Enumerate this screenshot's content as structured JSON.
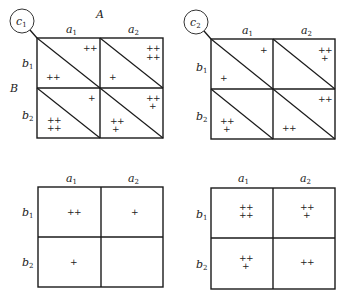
{
  "panels": [
    {
      "id": "top-left",
      "circle_label": "c",
      "circle_sub": "1",
      "factor_A": "A",
      "factor_B": "B",
      "col_labels": [
        {
          "base": "a",
          "sub": "1"
        },
        {
          "base": "a",
          "sub": "2"
        }
      ],
      "row_labels": [
        {
          "base": "b",
          "sub": "1"
        },
        {
          "base": "b",
          "sub": "2"
        }
      ],
      "split_diagonal": true,
      "cells": {
        "b1a1": {
          "upper": [
            "++"
          ],
          "lower": [
            "++"
          ]
        },
        "b1a2": {
          "upper": [
            "++",
            "++"
          ],
          "lower": [
            "+"
          ]
        },
        "b2a1": {
          "upper": [
            "+"
          ],
          "lower": [
            "++",
            "++"
          ]
        },
        "b2a2": {
          "upper": [
            "++",
            "+"
          ],
          "lower": [
            "++",
            "+"
          ]
        }
      }
    },
    {
      "id": "top-right",
      "circle_label": "c",
      "circle_sub": "2",
      "col_labels": [
        {
          "base": "a",
          "sub": "1"
        },
        {
          "base": "a",
          "sub": "2"
        }
      ],
      "row_labels": [
        {
          "base": "b",
          "sub": "1"
        },
        {
          "base": "b",
          "sub": "2"
        }
      ],
      "split_diagonal": true,
      "cells": {
        "b1a1": {
          "upper": [
            "+"
          ],
          "lower": [
            "+"
          ]
        },
        "b1a2": {
          "upper": [
            "++",
            "+"
          ],
          "lower": []
        },
        "b2a1": {
          "upper": [],
          "lower": [
            "++",
            "+"
          ]
        },
        "b2a2": {
          "upper": [
            "++"
          ],
          "lower": [
            "++"
          ]
        }
      }
    },
    {
      "id": "bottom-left",
      "col_labels": [
        {
          "base": "a",
          "sub": "1"
        },
        {
          "base": "a",
          "sub": "2"
        }
      ],
      "row_labels": [
        {
          "base": "b",
          "sub": "1"
        },
        {
          "base": "b",
          "sub": "2"
        }
      ],
      "split_diagonal": false,
      "cells": {
        "b1a1": [
          "++"
        ],
        "b1a2": [
          "+"
        ],
        "b2a1": [
          "+"
        ],
        "b2a2": []
      }
    },
    {
      "id": "bottom-right",
      "col_labels": [
        {
          "base": "a",
          "sub": "1"
        },
        {
          "base": "a",
          "sub": "2"
        }
      ],
      "row_labels": [
        {
          "base": "b",
          "sub": "1"
        },
        {
          "base": "b",
          "sub": "2"
        }
      ],
      "split_diagonal": false,
      "cells": {
        "b1a1": [
          "++",
          "++"
        ],
        "b1a2": [
          "++",
          "+"
        ],
        "b2a1": [
          "++",
          "+"
        ],
        "b2a2": [
          "++"
        ]
      }
    }
  ]
}
